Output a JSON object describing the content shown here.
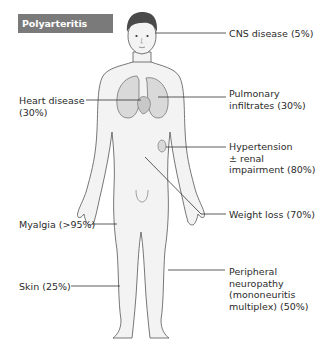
{
  "title": "Polyarteritis nodosa",
  "colors": {
    "title_bg": "#7a7a7a",
    "title_text": "#ffffff",
    "body_fill": "#f3f3f3",
    "organ_fill": "#d9d9d9",
    "outline": "#555555",
    "leader_line": "#333333",
    "hair": "#4a4a4a"
  },
  "annotations": {
    "cns": {
      "line1": "CNS disease (5%)",
      "side": "right",
      "target": "head"
    },
    "pulmonary": {
      "line1": "Pulmonary",
      "line2": "infiltrates (30%)",
      "side": "right",
      "target": "lungs"
    },
    "heart": {
      "line1": "Heart disease",
      "line2": "(30%)",
      "side": "left",
      "target": "heart"
    },
    "hypertension": {
      "line1": "Hypertension",
      "line2": "± renal",
      "line3": "impairment (80%)",
      "side": "right",
      "target": "kidney"
    },
    "weight": {
      "line1": "Weight loss (70%)",
      "side": "right",
      "target": "abdomen"
    },
    "myalgia": {
      "line1": "Myalgia (>95%)",
      "side": "left",
      "target": "thigh"
    },
    "skin": {
      "line1": "Skin (25%)",
      "side": "left",
      "target": "lower-leg"
    },
    "neuropathy": {
      "line1": "Peripheral",
      "line2": "neuropathy",
      "line3": "(mononeuritis",
      "line4": "multiplex) (50%)",
      "side": "right",
      "target": "lower-leg"
    }
  }
}
